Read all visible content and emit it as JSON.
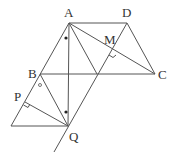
{
  "diagram": {
    "points": {
      "A": {
        "label": "A",
        "x": 69,
        "y": 23
      },
      "D": {
        "label": "D",
        "x": 127,
        "y": 23
      },
      "C": {
        "label": "C",
        "x": 155,
        "y": 74
      },
      "B": {
        "label": "B",
        "x": 40,
        "y": 74
      },
      "Q": {
        "label": "Q",
        "x": 68,
        "y": 126
      },
      "P": {
        "label": "P",
        "x": 25,
        "y": 102
      },
      "M": {
        "label": "M",
        "x": 113,
        "y": 52
      }
    },
    "labels": {
      "A": "A",
      "D": "D",
      "M": "M",
      "B": "B",
      "C": "C",
      "P": "P",
      "Q": "Q"
    },
    "marks": {
      "equal_angle_dots": 2,
      "small_circle_angle": 1,
      "right_angles": 2
    }
  }
}
